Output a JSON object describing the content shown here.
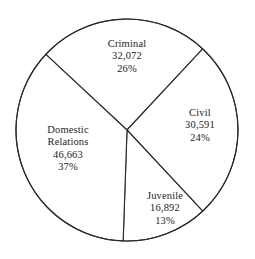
{
  "chart_data": {
    "type": "pie",
    "title": "",
    "subtitle": "",
    "xlabel": "",
    "ylabel": "",
    "legend_position": "none",
    "grid": false,
    "labels_inside_slices": true,
    "total": 126218,
    "categories": [
      "Criminal",
      "Civil",
      "Juvenile",
      "Domestic Relations"
    ],
    "values": [
      32072,
      30591,
      16892,
      46663
    ],
    "percentages": [
      26,
      24,
      13,
      37
    ],
    "value_labels": [
      "32,072",
      "30,591",
      "16,892",
      "46,663"
    ],
    "percent_labels": [
      "26%",
      "24%",
      "13%",
      "37%"
    ],
    "slices": [
      {
        "name": "Criminal",
        "value": 32072,
        "value_label": "32,072",
        "percent": 26,
        "percent_label": "26%",
        "start_angle": 313,
        "end_angle": 43,
        "fill": "#ffffff",
        "stroke": "#2b2b2b"
      },
      {
        "name": "Civil",
        "value": 30591,
        "value_label": "30,591",
        "percent": 24,
        "percent_label": "24%",
        "start_angle": 43,
        "end_angle": 137,
        "fill": "#ffffff",
        "stroke": "#2b2b2b"
      },
      {
        "name": "Juvenile",
        "value": 16892,
        "value_label": "16,892",
        "percent": 13,
        "percent_label": "13%",
        "start_angle": 137,
        "end_angle": 182,
        "fill": "#ffffff",
        "stroke": "#2b2b2b"
      },
      {
        "name": "Domestic Relations",
        "value": 46663,
        "value_label": "46,663",
        "percent": 37,
        "percent_label": "37%",
        "start_angle": 182,
        "end_angle": 313,
        "fill": "#ffffff",
        "stroke": "#2b2b2b"
      }
    ]
  },
  "labels": {
    "criminal": {
      "name": "Criminal",
      "value": "32,072",
      "percent": "26%"
    },
    "civil": {
      "name": "Civil",
      "value": "30,591",
      "percent": "24%"
    },
    "domestic": {
      "name_line1": "Domestic",
      "name_line2": "Relations",
      "value": "46,663",
      "percent": "37%"
    },
    "juvenile": {
      "name": "Juvenile",
      "value": "16,892",
      "percent": "13%"
    }
  },
  "colors": {
    "background": "#ffffff",
    "outline": "#2b2b2b",
    "slice_fill": "#ffffff",
    "text": "#1d1d1d"
  },
  "geometry": {
    "center_x": 127,
    "center_y": 130,
    "radius": 111
  }
}
